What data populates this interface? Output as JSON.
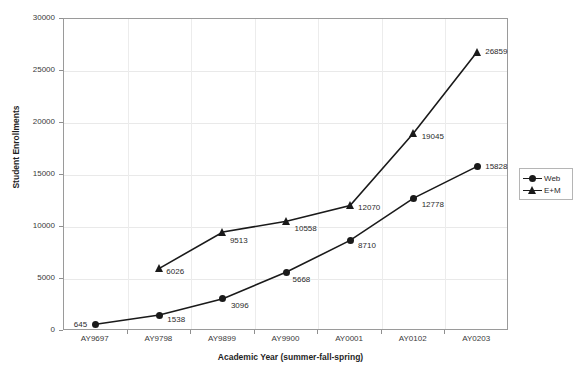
{
  "chart_data": {
    "type": "line",
    "title": "",
    "xlabel": "Academic Year (summer-fall-spring)",
    "ylabel": "Student Enrollments",
    "categories": [
      "AY9697",
      "AY9798",
      "AY9899",
      "AY9900",
      "AY0001",
      "AY0102",
      "AY0203"
    ],
    "ylim": [
      0,
      30000
    ],
    "yticks": [
      0,
      5000,
      10000,
      15000,
      20000,
      25000,
      30000
    ],
    "ytick_labels": [
      "0",
      "5000",
      "10000",
      "15000",
      "20000",
      "25000",
      "30000"
    ],
    "grid": true,
    "legend_position": "right",
    "series": [
      {
        "name": "Web",
        "marker": "circle",
        "color": "#1a1a1a",
        "values": [
          645,
          1538,
          3096,
          5668,
          8710,
          12778,
          15828
        ],
        "labels": [
          "645",
          "1538",
          "3096",
          "5668",
          "8710",
          "12778",
          "15828"
        ]
      },
      {
        "name": "E+M",
        "marker": "triangle",
        "color": "#1a1a1a",
        "values": [
          null,
          6026,
          9513,
          10558,
          12070,
          19045,
          26859
        ],
        "labels": [
          "",
          "6026",
          "9513",
          "10558",
          "12070",
          "19045",
          "26859"
        ]
      }
    ]
  },
  "legend": {
    "items": [
      {
        "label": "Web",
        "marker": "circle"
      },
      {
        "label": "E+M",
        "marker": "triangle"
      }
    ]
  },
  "axes": {
    "y_title": "Student Enrollments",
    "x_title": "Academic Year (summer-fall-spring)"
  }
}
